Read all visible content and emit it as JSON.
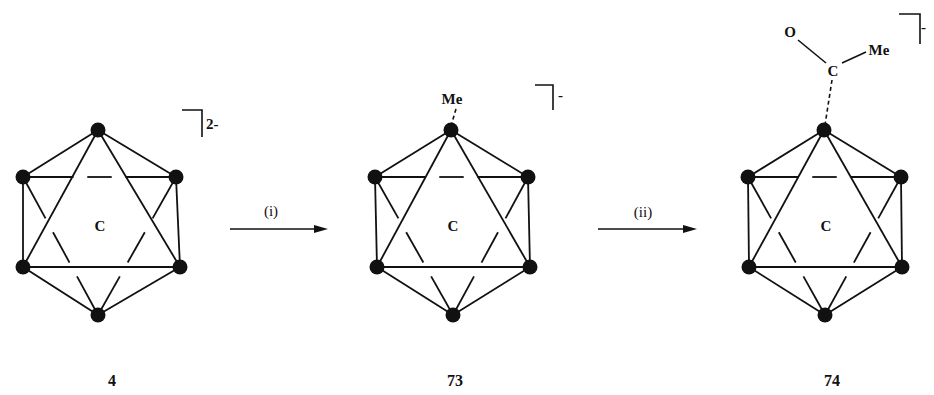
{
  "scheme": {
    "type": "reaction-scheme",
    "compounds": [
      {
        "id": "4",
        "label": "4",
        "cluster_atom": "C",
        "charge": "2-",
        "substituent": null
      },
      {
        "id": "73",
        "label": "73",
        "cluster_atom": "C",
        "charge": "-",
        "substituent": {
          "text": "Me"
        }
      },
      {
        "id": "74",
        "label": "74",
        "cluster_atom": "C",
        "charge": "-",
        "substituent": {
          "carbon": "C",
          "oxygen": "O",
          "methyl": "Me"
        }
      }
    ],
    "steps": [
      {
        "label": "(i)",
        "from": "4",
        "to": "73"
      },
      {
        "label": "(ii)",
        "from": "73",
        "to": "74"
      }
    ],
    "colors": {
      "ink": "#111111",
      "background": "#ffffff"
    }
  }
}
